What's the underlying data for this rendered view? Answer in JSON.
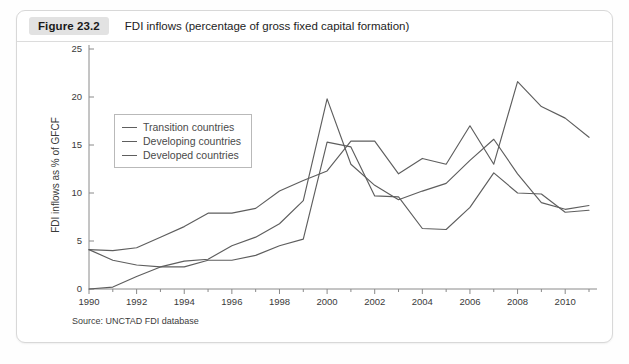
{
  "figure": {
    "badge": "Figure 23.2",
    "title": "FDI inflows (percentage of gross fixed capital formation)",
    "source": "Source: UNCTAD FDI database"
  },
  "legend": {
    "position": "top-left-inside",
    "items": [
      {
        "label": "Transition countries",
        "color": "#5e5e5e"
      },
      {
        "label": "Developing countries",
        "color": "#5e5e5e"
      },
      {
        "label": "Developed countries",
        "color": "#5e5e5e"
      }
    ]
  },
  "axes": {
    "y_title": "FDI inflows as % of GFCF",
    "y_ticks": [
      "0",
      "5",
      "10",
      "15",
      "20",
      "25"
    ],
    "x_ticks": [
      "1990",
      "1992",
      "1994",
      "1996",
      "1998",
      "2000",
      "2002",
      "2004",
      "2006",
      "2008",
      "2010"
    ]
  },
  "chart_data": {
    "type": "line",
    "title": "FDI inflows (percentage of gross fixed capital formation)",
    "xlabel": "",
    "ylabel": "FDI inflows as % of GFCF",
    "xlim": [
      1990,
      2011
    ],
    "ylim": [
      0,
      25
    ],
    "grid": false,
    "legend_position": "upper left",
    "x": [
      1990,
      1991,
      1992,
      1993,
      1994,
      1995,
      1996,
      1997,
      1998,
      1999,
      2000,
      2001,
      2002,
      2003,
      2004,
      2005,
      2006,
      2007,
      2008,
      2009,
      2010,
      2011
    ],
    "series": [
      {
        "name": "Transition countries",
        "color": "#5e5e5e",
        "values": [
          0.0,
          0.2,
          1.3,
          2.3,
          2.9,
          3.1,
          4.5,
          5.4,
          6.8,
          9.2,
          19.8,
          13.0,
          10.8,
          9.3,
          10.2,
          11.0,
          13.4,
          15.6,
          12.0,
          9.0,
          8.3,
          8.7
        ]
      },
      {
        "name": "Developing countries",
        "color": "#5e5e5e",
        "values": [
          4.1,
          4.0,
          4.3,
          5.4,
          6.5,
          7.9,
          7.9,
          8.4,
          10.2,
          11.3,
          12.3,
          15.4,
          15.4,
          12.0,
          13.6,
          13.0,
          17.0,
          13.0,
          21.6,
          19.0,
          17.8,
          15.8
        ],
        "note": "plateau 15.4 across 1999-2000 peak region; 2008 peak 21.6; ends ~15"
      },
      {
        "name": "Developed countries",
        "color": "#5e5e5e",
        "values": [
          4.1,
          3.0,
          2.5,
          2.3,
          2.3,
          3.0,
          3.0,
          3.5,
          4.5,
          5.2,
          15.3,
          14.8,
          9.7,
          9.6,
          6.3,
          6.2,
          8.5,
          12.1,
          10.0,
          9.9,
          8.0,
          8.2
        ]
      }
    ]
  }
}
